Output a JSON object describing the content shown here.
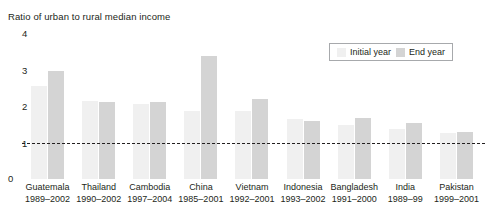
{
  "chart_data": {
    "type": "bar",
    "title": "Ratio of urban to rural median income",
    "xlabel": "",
    "ylabel": "Ratio of urban to rural median income",
    "ylim": [
      0,
      4
    ],
    "yticks": [
      "0",
      "1",
      "2",
      "3",
      "4"
    ],
    "grid": false,
    "legend_position": "top-right",
    "reference_line": {
      "value": 1,
      "style": "dashed",
      "color": "#231f20"
    },
    "categories": [
      "Guatemala",
      "Thailand",
      "Cambodia",
      "China",
      "Vietnam",
      "Indonesia",
      "Bangladesh",
      "India",
      "Pakistan"
    ],
    "periods": [
      "1989–2002",
      "1990–2002",
      "1997–2004",
      "1985–2001",
      "1992–2001",
      "1993–2002",
      "1991–2000",
      "1989–99",
      "1999–2001"
    ],
    "series": [
      {
        "name": "Initial year",
        "color": "#f0f0f0",
        "values": [
          2.55,
          2.15,
          2.05,
          1.87,
          1.87,
          1.65,
          1.47,
          1.37,
          1.27
        ]
      },
      {
        "name": "End year",
        "color": "#d4d4d4",
        "values": [
          2.95,
          2.1,
          2.1,
          3.38,
          2.18,
          1.6,
          1.67,
          1.53,
          1.3
        ]
      }
    ]
  },
  "legend": {
    "items": [
      {
        "label": "Initial year",
        "swatch": "initial"
      },
      {
        "label": "End year",
        "swatch": "end"
      }
    ]
  }
}
